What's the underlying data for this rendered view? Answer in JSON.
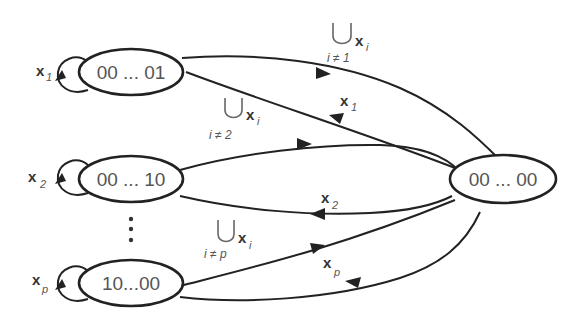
{
  "diagram": {
    "type": "state-transition-diagram",
    "nodes": [
      {
        "id": "s1",
        "label": "00 ... 01",
        "self_loop_label": "x",
        "self_loop_sub": "1"
      },
      {
        "id": "s2",
        "label": "00 ... 10",
        "self_loop_label": "x",
        "self_loop_sub": "2"
      },
      {
        "id": "sp",
        "label": "10...00",
        "self_loop_label": "x",
        "self_loop_sub": "p"
      },
      {
        "id": "s0",
        "label": "00 ... 00"
      }
    ],
    "ellipsis": "⋮",
    "edges": [
      {
        "from": "s1",
        "to": "s0",
        "label_union": "⋃",
        "label": "x",
        "sub": "i",
        "condition": "i ≠ 1"
      },
      {
        "from": "s0",
        "to": "s1",
        "label": "x",
        "sub": "1"
      },
      {
        "from": "s2",
        "to": "s0",
        "label_union": "⋃",
        "label": "x",
        "sub": "i",
        "condition": "i ≠ 2"
      },
      {
        "from": "s0",
        "to": "s2",
        "label": "x",
        "sub": "2"
      },
      {
        "from": "sp",
        "to": "s0",
        "label_union": "⋃",
        "label": "x",
        "sub": "i",
        "condition": "i ≠ p"
      },
      {
        "from": "s0",
        "to": "sp",
        "label": "x",
        "sub": "p"
      }
    ]
  }
}
